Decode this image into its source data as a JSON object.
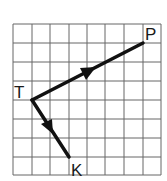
{
  "diagram": {
    "type": "vector-grid",
    "grid": {
      "columns": 8,
      "rows": 8,
      "x0": 13,
      "y0": 24,
      "cell": 18.5,
      "line_color": "#555555"
    },
    "points": [
      {
        "name": "T",
        "grid": [
          1,
          4
        ]
      },
      {
        "name": "P",
        "grid": [
          7,
          1
        ]
      },
      {
        "name": "K",
        "grid": [
          3,
          7
        ]
      }
    ],
    "vectors": [
      {
        "from": "T",
        "to": "P"
      },
      {
        "from": "T",
        "to": "K"
      }
    ],
    "labels": {
      "T": "T",
      "P": "P",
      "K": "K"
    },
    "stroke_color": "#111111"
  }
}
